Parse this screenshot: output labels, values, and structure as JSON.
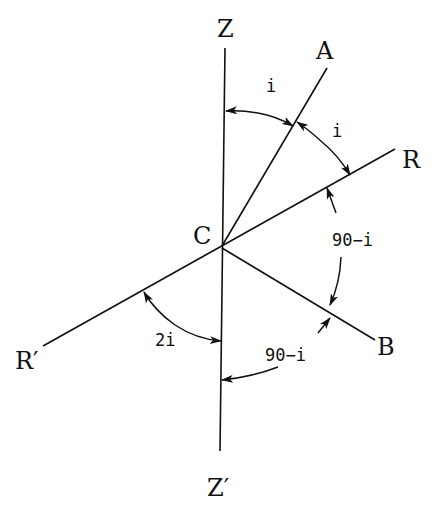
{
  "diagram": {
    "center": {
      "id": "C",
      "label": "C"
    },
    "points": {
      "Z": {
        "label": "Z"
      },
      "Z_prime": {
        "label": "Z′"
      },
      "A": {
        "label": "A"
      },
      "R": {
        "label": "R"
      },
      "R_prime": {
        "label": "R′"
      },
      "B": {
        "label": "B"
      },
      "C": {
        "label": "C"
      }
    },
    "lines": [
      {
        "name": "Z-Zprime",
        "from": "Z",
        "to": "Z′",
        "through": "C"
      },
      {
        "name": "C-A",
        "from": "C",
        "to": "A"
      },
      {
        "name": "R-Rprime",
        "from": "R",
        "to": "R′",
        "through": "C"
      },
      {
        "name": "C-B",
        "from": "C",
        "to": "B"
      }
    ],
    "angles": [
      {
        "name": "angle-Z-A",
        "between": [
          "Z",
          "A"
        ],
        "label": "i"
      },
      {
        "name": "angle-A-R",
        "between": [
          "A",
          "R"
        ],
        "label": "i"
      },
      {
        "name": "angle-R-B",
        "between": [
          "R",
          "B"
        ],
        "label": "90−i"
      },
      {
        "name": "angle-B-Zprime",
        "between": [
          "B",
          "Z′"
        ],
        "label": "90−i"
      },
      {
        "name": "angle-Rprime-Zprime",
        "between": [
          "R′",
          "Z′"
        ],
        "label": "2i"
      }
    ],
    "colors": {
      "stroke": "#111111",
      "background": "#ffffff"
    }
  }
}
